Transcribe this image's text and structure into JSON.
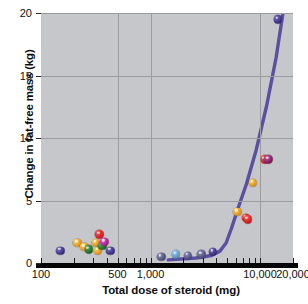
{
  "chart_data": {
    "type": "scatter",
    "title": "",
    "xlabel": "Total dose of steroid (mg)",
    "ylabel": "Change in fat-free mass (kg)",
    "xscale": "log",
    "yscale": "linear",
    "xlim": [
      100,
      20000
    ],
    "ylim": [
      0,
      20
    ],
    "xticks": [
      100,
      500,
      1000,
      10000,
      20000
    ],
    "xtick_labels": [
      "100",
      "500",
      "1,000",
      "10,000",
      "20,000"
    ],
    "yticks": [
      0,
      5,
      10,
      15,
      20
    ],
    "ytick_labels": [
      "0",
      "5",
      "10",
      "15",
      "20"
    ],
    "grid": true,
    "legend": "none",
    "series": [
      {
        "name": "observations",
        "points": [
          {
            "x": 150,
            "y": 1.0,
            "color": "#4a3d8f"
          },
          {
            "x": 215,
            "y": 1.6,
            "color": "#e8a12e"
          },
          {
            "x": 248,
            "y": 1.3,
            "color": "#e8a12e"
          },
          {
            "x": 272,
            "y": 1.1,
            "color": "#2f7a35"
          },
          {
            "x": 318,
            "y": 1.6,
            "color": "#e8a12e"
          },
          {
            "x": 330,
            "y": 1.0,
            "color": "#e8a12e"
          },
          {
            "x": 340,
            "y": 2.3,
            "color": "#d82b2b"
          },
          {
            "x": 362,
            "y": 1.4,
            "color": "#2f7a35"
          },
          {
            "x": 380,
            "y": 1.7,
            "color": "#b5309a"
          },
          {
            "x": 430,
            "y": 1.0,
            "color": "#4a3d8f"
          },
          {
            "x": 1250,
            "y": 0.5,
            "color": "#5c5f8c"
          },
          {
            "x": 1700,
            "y": 0.7,
            "color": "#6f9fc4"
          },
          {
            "x": 2200,
            "y": 0.6,
            "color": "#5c5f8c"
          },
          {
            "x": 2900,
            "y": 0.7,
            "color": "#5c5f8c"
          },
          {
            "x": 3700,
            "y": 0.9,
            "color": "#4a3d8f"
          },
          {
            "x": 6200,
            "y": 4.1,
            "color": "#e8a12e"
          },
          {
            "x": 7400,
            "y": 3.6,
            "color": "#d82b2b"
          },
          {
            "x": 7700,
            "y": 3.5,
            "color": "#d82b2b"
          },
          {
            "x": 8600,
            "y": 6.4,
            "color": "#e8a12e"
          },
          {
            "x": 11000,
            "y": 8.3,
            "color": "#d82b2b"
          },
          {
            "x": 11900,
            "y": 8.3,
            "color": "#8e2b6e"
          },
          {
            "x": 14600,
            "y": 19.5,
            "color": "#4a3d8f"
          }
        ]
      }
    ],
    "fit_curve": {
      "name": "regression-line",
      "color": "#5a4fa0",
      "points": [
        {
          "x": 1450,
          "y": 0.25
        },
        {
          "x": 2600,
          "y": 0.4
        },
        {
          "x": 3600,
          "y": 0.6
        },
        {
          "x": 4300,
          "y": 0.95
        },
        {
          "x": 4900,
          "y": 1.6
        },
        {
          "x": 5500,
          "y": 2.8
        },
        {
          "x": 6200,
          "y": 4.2
        },
        {
          "x": 7500,
          "y": 6.3
        },
        {
          "x": 9200,
          "y": 9.0
        },
        {
          "x": 11500,
          "y": 12.6
        },
        {
          "x": 14000,
          "y": 16.4
        },
        {
          "x": 16200,
          "y": 20.0
        }
      ]
    }
  },
  "colors": {
    "plot_background": "#c5c7ca",
    "grid": "#9a9ca0",
    "axis": "#050505",
    "curve": "#5a4fa0",
    "page_background": "#ffffff"
  }
}
